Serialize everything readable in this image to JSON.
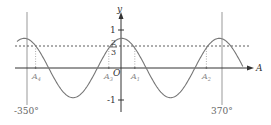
{
  "chart_data": {
    "type": "line",
    "title": "",
    "xlabel": "A",
    "ylabel": "y",
    "function": "y = 0.9·cos(A)",
    "x_range_deg": [
      -387,
      447
    ],
    "ylim": [
      -1.2,
      1.3
    ],
    "y_ticks": [
      "1",
      "-1"
    ],
    "reference_line": {
      "y": 0.6667,
      "label_num": "2",
      "label_den": "3",
      "style": "dashed"
    },
    "vertical_lines": [
      {
        "x": -350,
        "label": "-350°"
      },
      {
        "x": 370,
        "label": "370°"
      }
    ],
    "intersection_points": [
      {
        "label": "A",
        "sub": "4",
        "x": -318
      },
      {
        "label": "A",
        "sub": "3",
        "x": -48
      },
      {
        "label": "A",
        "sub": "1",
        "x": 48
      },
      {
        "label": "A",
        "sub": "2",
        "x": 312
      }
    ],
    "origin_label": "O",
    "grid": false,
    "legend": null
  },
  "labels": {
    "y_axis": "y",
    "x_axis": "A",
    "origin": "O",
    "tick_one": "1",
    "tick_neg_one": "-1",
    "frac_num": "2",
    "frac_den": "3",
    "left_bound": "-350°",
    "right_bound": "370°",
    "a4": "A",
    "a4_sub": "4",
    "a3": "A",
    "a3_sub": "3",
    "a1": "A",
    "a1_sub": "1",
    "a2": "A",
    "a2_sub": "2"
  }
}
